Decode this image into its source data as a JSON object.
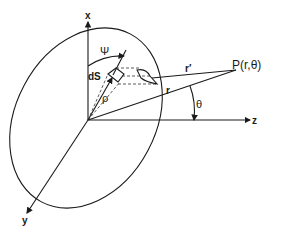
{
  "diagram": {
    "type": "geometry-figure",
    "axes": {
      "x_label": "x",
      "y_label": "y",
      "z_label": "z"
    },
    "labels": {
      "psi": "Ψ",
      "dS": "dS",
      "rho": "ρ",
      "r_prime": "r′",
      "r": "r",
      "point": "P(r,θ)",
      "theta": "θ"
    },
    "colors": {
      "ink": "#1a1a1a",
      "background": "#ffffff"
    }
  }
}
